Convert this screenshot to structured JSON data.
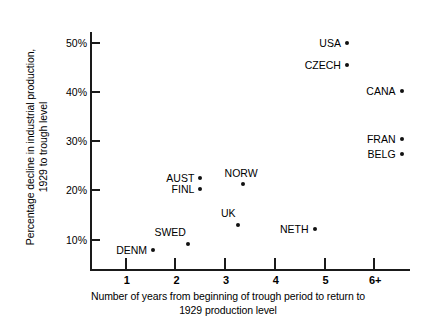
{
  "chart_data": {
    "type": "scatter",
    "title": "",
    "xlabel": "Number of years from beginning of trough period to return to 1929 production level",
    "xlabel_lines": [
      "Number of years from beginning of trough period to return to",
      "1929 production level"
    ],
    "ylabel": "Percentage decline in industrial production, 1929 to trough level",
    "ylabel_lines": [
      "Percentage decline in industrial production,",
      "1929 to trough level"
    ],
    "xticks": [
      1,
      2,
      3,
      4,
      5,
      6
    ],
    "xtick_labels": [
      "1",
      "2",
      "3",
      "4",
      "5",
      "6+"
    ],
    "yticks": [
      10,
      20,
      30,
      40,
      50
    ],
    "ytick_labels": [
      "10%",
      "20%",
      "30%",
      "40%",
      "50%"
    ],
    "xlim": [
      0.3,
      6.7
    ],
    "ylim": [
      4.0,
      52.0
    ],
    "grid": false,
    "legend": false,
    "point_color": "#111111",
    "axis_color": "#1a1a1a",
    "points": [
      {
        "label": "USA",
        "x": 5.45,
        "y": 50.0,
        "label_side": "left"
      },
      {
        "label": "CZECH",
        "x": 5.45,
        "y": 45.5,
        "label_side": "left"
      },
      {
        "label": "CANA",
        "x": 6.55,
        "y": 40.3,
        "label_side": "left"
      },
      {
        "label": "FRAN",
        "x": 6.55,
        "y": 30.5,
        "label_side": "left"
      },
      {
        "label": "BELG",
        "x": 6.55,
        "y": 27.3,
        "label_side": "left"
      },
      {
        "label": "AUST",
        "x": 2.5,
        "y": 22.5,
        "label_side": "left"
      },
      {
        "label": "NORW",
        "x": 3.35,
        "y": 21.2,
        "label_side": "above"
      },
      {
        "label": "FINL",
        "x": 2.5,
        "y": 20.3,
        "label_side": "left"
      },
      {
        "label": "UK",
        "x": 3.25,
        "y": 12.9,
        "label_side": "above-left"
      },
      {
        "label": "NETH",
        "x": 4.8,
        "y": 12.2,
        "label_side": "left"
      },
      {
        "label": "SWED",
        "x": 2.25,
        "y": 9.0,
        "label_side": "above-left"
      },
      {
        "label": "DENM",
        "x": 1.55,
        "y": 7.8,
        "label_side": "left"
      }
    ]
  }
}
